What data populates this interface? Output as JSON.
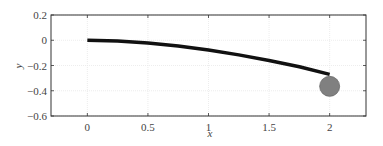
{
  "chart_data": {
    "type": "line",
    "title": "",
    "xlabel": "x",
    "ylabel": "y",
    "xlim": [
      -0.3,
      2.3
    ],
    "ylim": [
      -0.6,
      0.2
    ],
    "xticks": [
      0,
      0.5,
      1,
      1.5,
      2
    ],
    "xtick_labels": [
      "0",
      "0.5",
      "1",
      "1.5",
      "2"
    ],
    "yticks": [
      0.2,
      0,
      -0.2,
      -0.4,
      -0.6
    ],
    "ytick_labels": [
      "0.2",
      "0",
      "−0.2",
      "−0.4",
      "−0.6"
    ],
    "grid": true,
    "legend": null,
    "series": [
      {
        "name": "beam",
        "color": "#111111",
        "x": [
          0,
          0.25,
          0.5,
          0.75,
          1.0,
          1.25,
          1.5,
          1.75,
          2.0
        ],
        "y": [
          0,
          -0.006,
          -0.021,
          -0.045,
          -0.078,
          -0.116,
          -0.16,
          -0.21,
          -0.27
        ]
      }
    ],
    "markers": [
      {
        "name": "mass",
        "x": 2.0,
        "y": -0.365,
        "radius": 0.08,
        "color": "#808080"
      }
    ]
  }
}
